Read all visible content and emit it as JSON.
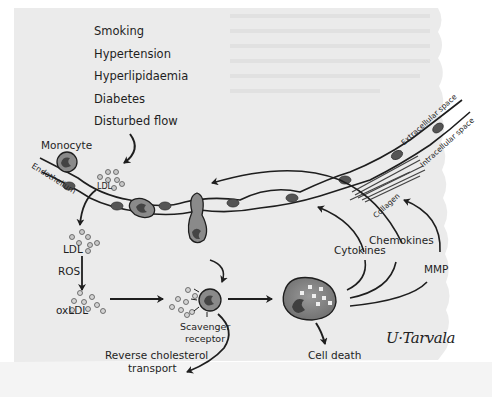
{
  "risk_factors": [
    "Smoking",
    "Hypertension",
    "Hyperlipidaemia",
    "Diabetes",
    "Disturbed flow"
  ],
  "labels": {
    "monocyte": "Monocyte",
    "endothelium": "Endothelium",
    "ldl_top": "LDL",
    "ldl_mid": "LDL",
    "ros": "ROS",
    "oxldl": "oxLDL",
    "scavenger_receptor_1": "Scavenger",
    "scavenger_receptor_2": "receptor",
    "reverse_cholesterol_1": "Reverse cholesterol",
    "reverse_cholesterol_2": "transport",
    "cell_death": "Cell death",
    "cytokines": "Cytokines",
    "chemokines": "Chemokines",
    "mmp": "MMP",
    "extracellular_space": "Extracellular space",
    "intracellular_space": "Intracellular space",
    "collagen": "Collagen"
  },
  "signature": "U·Tarvala",
  "colors": {
    "paper": "#ececec",
    "ink": "#1e1e1e",
    "cell_fill": "#8a8a8a",
    "nucleus": "#555555",
    "particle_fill": "#c8c8c8"
  }
}
